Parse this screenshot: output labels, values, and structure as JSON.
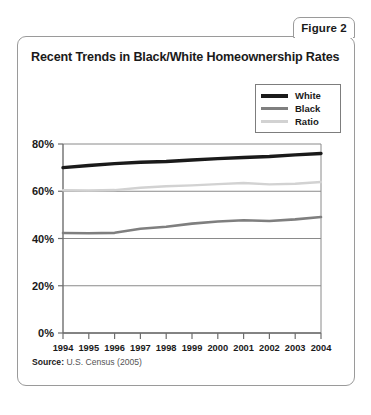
{
  "figure_tab": {
    "label": "Figure 2"
  },
  "title": "Recent Trends in Black/White Homeownership Rates",
  "source": {
    "label": "Source:",
    "text": "U.S. Census (2005)"
  },
  "colors": {
    "white_series": "#1a1a1a",
    "black_series": "#7f7f7f",
    "ratio_series": "#d2d2d2",
    "grid": "#8a8a8a",
    "axis": "#6e6e6e",
    "border": "#9a9a9a",
    "text": "#1a1a1a"
  },
  "chart_data": {
    "type": "line",
    "title": "Recent Trends in Black/White Homeownership Rates",
    "xlabel": "",
    "ylabel": "",
    "grid": true,
    "legend_position": "top-right",
    "ylim": [
      0,
      80
    ],
    "ytick_labels": [
      "0%",
      "20%",
      "40%",
      "60%",
      "80%"
    ],
    "ytick_values": [
      0,
      20,
      40,
      60,
      80
    ],
    "categories": [
      "1994",
      "1995",
      "1996",
      "1997",
      "1998",
      "1999",
      "2000",
      "2001",
      "2002",
      "2003",
      "2004"
    ],
    "x": [
      1994,
      1995,
      1996,
      1997,
      1998,
      1999,
      2000,
      2001,
      2002,
      2003,
      2004
    ],
    "series": [
      {
        "name": "White",
        "color": "#1a1a1a",
        "values": [
          70.0,
          70.9,
          71.7,
          72.3,
          72.6,
          73.2,
          73.8,
          74.3,
          74.7,
          75.4,
          76.0
        ]
      },
      {
        "name": "Black",
        "color": "#7f7f7f",
        "values": [
          42.3,
          42.2,
          42.4,
          44.1,
          45.0,
          46.3,
          47.2,
          47.7,
          47.4,
          48.1,
          49.1
        ]
      },
      {
        "name": "Ratio",
        "color": "#d2d2d2",
        "values": [
          60.4,
          60.3,
          60.5,
          61.5,
          62.1,
          62.5,
          63.0,
          63.5,
          62.9,
          63.2,
          63.9
        ]
      }
    ]
  }
}
